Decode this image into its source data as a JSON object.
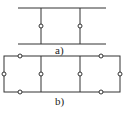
{
  "diagram_a": {
    "label": "a)",
    "rails": [
      {
        "y": 8,
        "x1": 18,
        "x2": 106
      },
      {
        "y": 44,
        "x1": 18,
        "x2": 106
      }
    ],
    "rungs": [
      {
        "x": 41,
        "y1": 8,
        "y2": 44,
        "node_y": 26
      },
      {
        "x": 80,
        "y1": 8,
        "y2": 44,
        "node_y": 26
      }
    ]
  },
  "diagram_b": {
    "label": "b)",
    "frame": {
      "x1": 4,
      "y1": 56,
      "x2": 120,
      "y2": 92
    },
    "rungs": [
      {
        "x": 41,
        "node_y": 74
      },
      {
        "x": 80,
        "node_y": 74
      }
    ],
    "nodes": [
      {
        "x": 20,
        "y": 56
      },
      {
        "x": 101,
        "y": 56
      },
      {
        "x": 20,
        "y": 92
      },
      {
        "x": 101,
        "y": 92
      },
      {
        "x": 4,
        "y": 74
      },
      {
        "x": 120,
        "y": 74
      }
    ]
  },
  "colors": {
    "stroke": "#333333",
    "node_fill": "#ffffff"
  }
}
